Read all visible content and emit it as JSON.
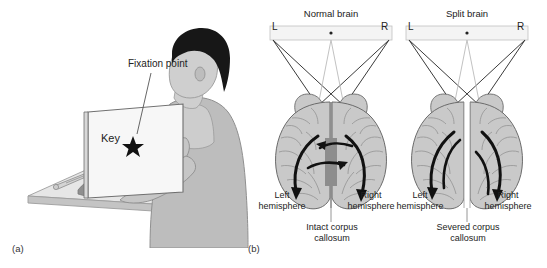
{
  "figure": {
    "panels": [
      {
        "id": "a",
        "label": "(a)",
        "annotations": {
          "fixation_label": "Fixation point",
          "key_label": "Key",
          "fixation_marker_icon": "star-icon"
        }
      },
      {
        "id": "b",
        "label": "(b)",
        "diagrams": [
          {
            "title": "Normal brain",
            "stimulus": {
              "left_letter": "L",
              "center_marker": "fixation-dot-icon",
              "right_letter": "R"
            },
            "left_hemisphere_label": "Left\nhemisphere",
            "right_hemisphere_label": "Right\nhemisphere",
            "callosum_label": "Intact corpus\ncallosum",
            "callosum_state": "intact"
          },
          {
            "title": "Split brain",
            "stimulus": {
              "left_letter": "L",
              "center_marker": "fixation-dot-icon",
              "right_letter": "R"
            },
            "left_hemisphere_label": "Left\nhemisphere",
            "right_hemisphere_label": "Right\nhemisphere",
            "callosum_label": "Severed corpus\ncallosum",
            "callosum_state": "severed"
          }
        ]
      }
    ]
  },
  "colors": {
    "background": "#ffffff",
    "brain_fill": "#c9c9c9",
    "brain_outline": "#6b6b6b",
    "sulci": "#8e8e8e",
    "arrow_dark": "#111111",
    "projection_dark": "#3a3a3a",
    "projection_light": "#bdbdbd",
    "callosum_grey": "#8a8a8a",
    "desk_top": "#e3e3e3",
    "desk_edge": "#b9b9b9",
    "screen_fill": "#f6f6f6",
    "screen_outline": "#777777",
    "shirt": "#bdbdbd",
    "shirt_shadow": "#9a9a9a",
    "skin": "#cfcfcf",
    "hair": "#1c1c1c",
    "text": "#222222"
  }
}
